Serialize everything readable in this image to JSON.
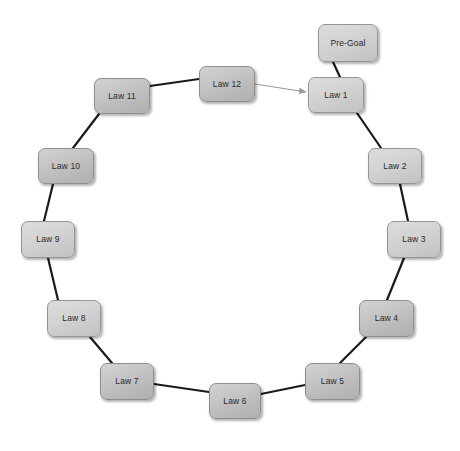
{
  "diagram": {
    "type": "cycle-diagram",
    "background_color": "#ffffff",
    "node_fill": "#c6c6c6",
    "node_border": "#8e8e8e",
    "node_text_color": "#2b2b2b",
    "edge_color": "#1a1a1a",
    "arrow_color": "#9a9a9a",
    "watermark": "",
    "nodes": [
      {
        "id": "pre-goal",
        "label": "Pre-Goal",
        "x": 318,
        "y": 24,
        "w": 60,
        "h": 38,
        "style": "light"
      },
      {
        "id": "law-1",
        "label": "Law 1",
        "x": 308,
        "y": 77,
        "w": 56,
        "h": 36,
        "style": "light"
      },
      {
        "id": "law-2",
        "label": "Law 2",
        "x": 368,
        "y": 148,
        "w": 54,
        "h": 36,
        "style": "light"
      },
      {
        "id": "law-3",
        "label": "Law 3",
        "x": 387,
        "y": 221,
        "w": 54,
        "h": 37,
        "style": "light"
      },
      {
        "id": "law-4",
        "label": "Law 4",
        "x": 359,
        "y": 300,
        "w": 55,
        "h": 37,
        "style": "normal"
      },
      {
        "id": "law-5",
        "label": "Law 5",
        "x": 305,
        "y": 363,
        "w": 55,
        "h": 37,
        "style": "normal"
      },
      {
        "id": "law-6",
        "label": "Law 6",
        "x": 209,
        "y": 383,
        "w": 52,
        "h": 36,
        "style": "normal"
      },
      {
        "id": "law-7",
        "label": "Law 7",
        "x": 100,
        "y": 363,
        "w": 54,
        "h": 37,
        "style": "normal"
      },
      {
        "id": "law-8",
        "label": "Law 8",
        "x": 47,
        "y": 300,
        "w": 54,
        "h": 37,
        "style": "light"
      },
      {
        "id": "law-9",
        "label": "Law 9",
        "x": 21,
        "y": 221,
        "w": 54,
        "h": 37,
        "style": "light"
      },
      {
        "id": "law-10",
        "label": "Law 10",
        "x": 38,
        "y": 148,
        "w": 56,
        "h": 36,
        "style": "normal"
      },
      {
        "id": "law-11",
        "label": "Law 11",
        "x": 94,
        "y": 78,
        "w": 56,
        "h": 36,
        "style": "normal"
      },
      {
        "id": "law-12",
        "label": "Law 12",
        "x": 199,
        "y": 66,
        "w": 56,
        "h": 36,
        "style": "normal"
      }
    ],
    "edges": [
      {
        "from": "pre-goal",
        "to": "law-1",
        "kind": "link",
        "x1": 333,
        "y1": 62,
        "x2": 340,
        "y2": 77
      },
      {
        "from": "law-1",
        "to": "law-2",
        "kind": "link",
        "x1": 357,
        "y1": 113,
        "x2": 381,
        "y2": 148
      },
      {
        "from": "law-2",
        "to": "law-3",
        "kind": "link",
        "x1": 400,
        "y1": 184,
        "x2": 408,
        "y2": 221
      },
      {
        "from": "law-3",
        "to": "law-4",
        "kind": "link",
        "x1": 404,
        "y1": 258,
        "x2": 387,
        "y2": 300
      },
      {
        "from": "law-4",
        "to": "law-5",
        "kind": "link",
        "x1": 366,
        "y1": 337,
        "x2": 340,
        "y2": 363
      },
      {
        "from": "law-5",
        "to": "law-6",
        "kind": "link",
        "x1": 305,
        "y1": 385,
        "x2": 261,
        "y2": 394
      },
      {
        "from": "law-6",
        "to": "law-7",
        "kind": "link",
        "x1": 209,
        "y1": 392,
        "x2": 154,
        "y2": 384
      },
      {
        "from": "law-7",
        "to": "law-8",
        "kind": "link",
        "x1": 112,
        "y1": 363,
        "x2": 90,
        "y2": 337
      },
      {
        "from": "law-8",
        "to": "law-9",
        "kind": "link",
        "x1": 58,
        "y1": 300,
        "x2": 48,
        "y2": 258
      },
      {
        "from": "law-9",
        "to": "law-10",
        "kind": "link",
        "x1": 44,
        "y1": 221,
        "x2": 53,
        "y2": 184
      },
      {
        "from": "law-10",
        "to": "law-11",
        "kind": "link",
        "x1": 73,
        "y1": 148,
        "x2": 99,
        "y2": 114
      },
      {
        "from": "law-11",
        "to": "law-12",
        "kind": "link",
        "x1": 150,
        "y1": 86,
        "x2": 199,
        "y2": 79
      },
      {
        "from": "law-12",
        "to": "law-1",
        "kind": "arrow",
        "x1": 255,
        "y1": 84,
        "x2": 306,
        "y2": 92
      }
    ]
  }
}
